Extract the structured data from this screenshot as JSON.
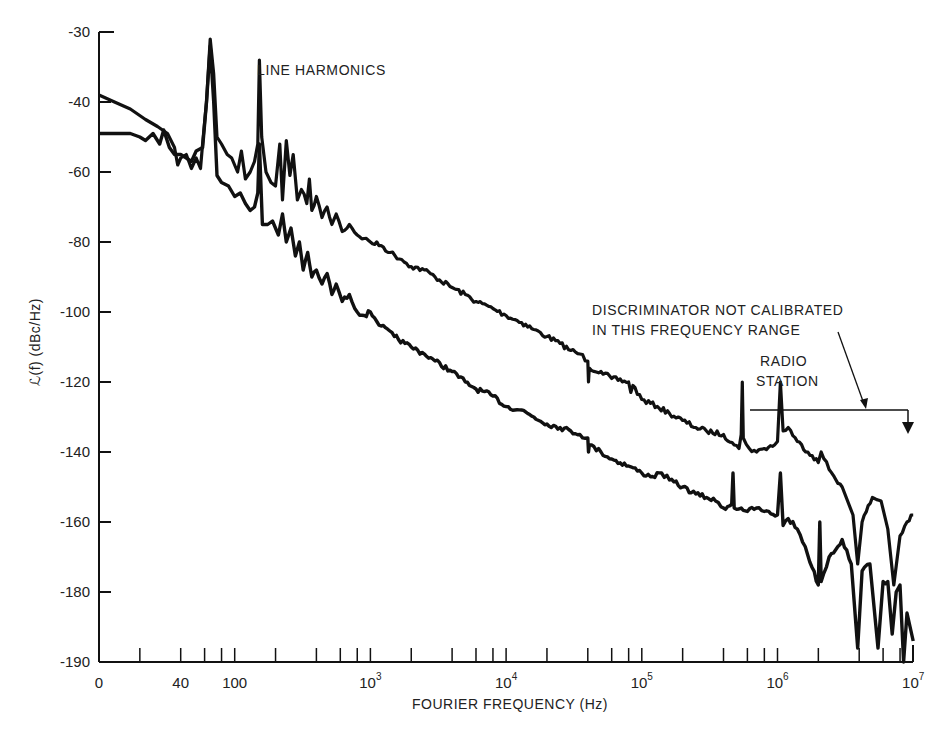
{
  "chart_data": {
    "type": "line",
    "title": "",
    "xlabel": "FOURIER FREQUENCY (Hz)",
    "ylabel": "ℒ(f) (dBc/Hz)",
    "x_scale": "log",
    "x_range_hz": [
      10,
      10000000
    ],
    "x_tick_labels": [
      {
        "value": 10,
        "label": "0"
      },
      {
        "value": 40,
        "label": "40"
      },
      {
        "value": 100,
        "label": "100"
      },
      {
        "value": 1000,
        "label": "10",
        "exp": "3"
      },
      {
        "value": 10000,
        "label": "10",
        "exp": "4"
      },
      {
        "value": 100000,
        "label": "10",
        "exp": "5"
      },
      {
        "value": 1000000,
        "label": "10",
        "exp": "6"
      },
      {
        "value": 10000000,
        "label": "10",
        "exp": "7"
      }
    ],
    "x_minor_ticks_per_decade": [
      2,
      4,
      6,
      8,
      10
    ],
    "y_tick_labels": [
      "-30",
      "-40",
      "-60",
      "-80",
      "-100",
      "-120",
      "-140",
      "-160",
      "-180",
      "-190"
    ],
    "y_tick_values": [
      -30,
      -40,
      -60,
      -80,
      -100,
      -120,
      -140,
      -160,
      -180,
      -190
    ],
    "ylim": [
      -190,
      -30
    ],
    "grid": false,
    "legend": "none",
    "series": [
      {
        "name": "upper trace",
        "points": [
          [
            10,
            -39
          ],
          [
            13,
            -40
          ],
          [
            17,
            -42
          ],
          [
            22,
            -45
          ],
          [
            27,
            -47
          ],
          [
            32,
            -49
          ],
          [
            36,
            -53
          ],
          [
            38,
            -58
          ],
          [
            40,
            -56
          ],
          [
            44,
            -55
          ],
          [
            48,
            -59
          ],
          [
            52,
            -56
          ],
          [
            56,
            -59
          ],
          [
            58,
            -52
          ],
          [
            62,
            -40
          ],
          [
            66,
            -31
          ],
          [
            70,
            -36
          ],
          [
            74,
            -50
          ],
          [
            80,
            -52
          ],
          [
            88,
            -55
          ],
          [
            95,
            -56
          ],
          [
            105,
            -60
          ],
          [
            112,
            -54
          ],
          [
            120,
            -62
          ],
          [
            130,
            -60
          ],
          [
            140,
            -57
          ],
          [
            148,
            -52
          ],
          [
            152,
            -34
          ],
          [
            158,
            -50
          ],
          [
            170,
            -60
          ],
          [
            185,
            -63
          ],
          [
            200,
            -64
          ],
          [
            215,
            -52
          ],
          [
            225,
            -68
          ],
          [
            240,
            -51
          ],
          [
            255,
            -61
          ],
          [
            270,
            -55
          ],
          [
            290,
            -68
          ],
          [
            310,
            -65
          ],
          [
            340,
            -69
          ],
          [
            355,
            -62
          ],
          [
            370,
            -71
          ],
          [
            400,
            -67
          ],
          [
            440,
            -73
          ],
          [
            480,
            -70
          ],
          [
            520,
            -75
          ],
          [
            560,
            -72
          ],
          [
            620,
            -77
          ],
          [
            700,
            -75
          ],
          [
            800,
            -78
          ],
          [
            900,
            -79
          ],
          [
            1000,
            -80
          ],
          [
            1200,
            -81
          ],
          [
            1400,
            -83
          ],
          [
            1700,
            -85
          ],
          [
            2000,
            -87
          ],
          [
            2500,
            -88
          ],
          [
            3000,
            -90
          ],
          [
            4000,
            -93
          ],
          [
            5000,
            -95
          ],
          [
            6000,
            -97
          ],
          [
            8000,
            -99
          ],
          [
            10000,
            -101
          ],
          [
            13000,
            -103
          ],
          [
            16000,
            -105
          ],
          [
            20000,
            -107
          ],
          [
            25000,
            -109
          ],
          [
            30000,
            -111
          ],
          [
            35000,
            -112
          ],
          [
            40000,
            -114
          ],
          [
            40500,
            -120
          ],
          [
            41000,
            -116
          ],
          [
            50000,
            -117
          ],
          [
            60000,
            -119
          ],
          [
            80000,
            -120
          ],
          [
            83000,
            -123
          ],
          [
            86000,
            -121
          ],
          [
            100000,
            -125
          ],
          [
            130000,
            -127
          ],
          [
            160000,
            -129
          ],
          [
            200000,
            -131
          ],
          [
            250000,
            -133
          ],
          [
            300000,
            -134
          ],
          [
            400000,
            -135
          ],
          [
            480000,
            -138
          ],
          [
            520000,
            -139
          ],
          [
            540000,
            -135
          ],
          [
            550000,
            -120
          ],
          [
            560000,
            -136
          ],
          [
            620000,
            -139
          ],
          [
            700000,
            -140
          ],
          [
            800000,
            -139
          ],
          [
            950000,
            -138
          ],
          [
            1000000,
            -137
          ],
          [
            1050000,
            -120
          ],
          [
            1100000,
            -134
          ],
          [
            1200000,
            -133
          ],
          [
            1400000,
            -137
          ],
          [
            1800000,
            -141
          ],
          [
            2000000,
            -143
          ],
          [
            2100000,
            -140
          ],
          [
            2400000,
            -145
          ],
          [
            3000000,
            -150
          ],
          [
            3600000,
            -158
          ],
          [
            3900000,
            -172
          ],
          [
            4200000,
            -160
          ],
          [
            5000000,
            -153
          ],
          [
            5800000,
            -154
          ],
          [
            6500000,
            -162
          ],
          [
            7200000,
            -178
          ],
          [
            8000000,
            -164
          ],
          [
            9000000,
            -160
          ],
          [
            10000000,
            -158
          ]
        ]
      },
      {
        "name": "lower trace",
        "points": [
          [
            10,
            -49
          ],
          [
            13,
            -49
          ],
          [
            17,
            -49
          ],
          [
            20,
            -50
          ],
          [
            22,
            -51
          ],
          [
            25,
            -49
          ],
          [
            28,
            -52
          ],
          [
            30,
            -48
          ],
          [
            33,
            -53
          ],
          [
            36,
            -55
          ],
          [
            40,
            -55
          ],
          [
            44,
            -56
          ],
          [
            48,
            -57
          ],
          [
            52,
            -54
          ],
          [
            58,
            -53
          ],
          [
            62,
            -40
          ],
          [
            66,
            -32
          ],
          [
            70,
            -40
          ],
          [
            74,
            -61
          ],
          [
            80,
            -63
          ],
          [
            90,
            -64
          ],
          [
            100,
            -67
          ],
          [
            110,
            -66
          ],
          [
            120,
            -69
          ],
          [
            130,
            -71
          ],
          [
            140,
            -70
          ],
          [
            148,
            -66
          ],
          [
            152,
            -52
          ],
          [
            160,
            -75
          ],
          [
            175,
            -75
          ],
          [
            190,
            -74
          ],
          [
            210,
            -78
          ],
          [
            225,
            -72
          ],
          [
            240,
            -80
          ],
          [
            260,
            -76
          ],
          [
            280,
            -84
          ],
          [
            300,
            -80
          ],
          [
            320,
            -88
          ],
          [
            345,
            -83
          ],
          [
            370,
            -90
          ],
          [
            400,
            -88
          ],
          [
            440,
            -92
          ],
          [
            480,
            -89
          ],
          [
            520,
            -95
          ],
          [
            560,
            -92
          ],
          [
            620,
            -97
          ],
          [
            700,
            -95
          ],
          [
            800,
            -100
          ],
          [
            900,
            -101
          ],
          [
            1000,
            -100
          ],
          [
            1200,
            -104
          ],
          [
            1500,
            -107
          ],
          [
            1800,
            -109
          ],
          [
            2000,
            -110
          ],
          [
            2500,
            -112
          ],
          [
            3000,
            -114
          ],
          [
            4000,
            -117
          ],
          [
            5000,
            -120
          ],
          [
            6000,
            -122
          ],
          [
            8000,
            -124
          ],
          [
            10000,
            -127
          ],
          [
            13000,
            -128
          ],
          [
            16000,
            -130
          ],
          [
            20000,
            -132
          ],
          [
            25000,
            -133
          ],
          [
            30000,
            -134
          ],
          [
            35000,
            -135
          ],
          [
            40000,
            -136
          ],
          [
            40500,
            -140
          ],
          [
            41000,
            -138
          ],
          [
            50000,
            -140
          ],
          [
            60000,
            -142
          ],
          [
            80000,
            -144
          ],
          [
            100000,
            -146
          ],
          [
            120000,
            -147
          ],
          [
            140000,
            -146
          ],
          [
            160000,
            -148
          ],
          [
            200000,
            -150
          ],
          [
            250000,
            -152
          ],
          [
            300000,
            -153
          ],
          [
            350000,
            -154
          ],
          [
            400000,
            -156
          ],
          [
            460000,
            -155
          ],
          [
            470000,
            -146
          ],
          [
            480000,
            -156
          ],
          [
            540000,
            -156
          ],
          [
            600000,
            -157
          ],
          [
            700000,
            -156
          ],
          [
            800000,
            -157
          ],
          [
            1000000,
            -158
          ],
          [
            1050000,
            -146
          ],
          [
            1100000,
            -161
          ],
          [
            1200000,
            -159
          ],
          [
            1400000,
            -162
          ],
          [
            1600000,
            -167
          ],
          [
            1800000,
            -173
          ],
          [
            2000000,
            -178
          ],
          [
            2050000,
            -160
          ],
          [
            2100000,
            -177
          ],
          [
            2400000,
            -170
          ],
          [
            3000000,
            -165
          ],
          [
            3500000,
            -172
          ],
          [
            3900000,
            -188
          ],
          [
            4200000,
            -174
          ],
          [
            4800000,
            -172
          ],
          [
            5500000,
            -188
          ],
          [
            6000000,
            -177
          ],
          [
            6500000,
            -177
          ],
          [
            7000000,
            -186
          ],
          [
            7500000,
            -180
          ],
          [
            8000000,
            -178
          ],
          [
            8500000,
            -190
          ],
          [
            9000000,
            -183
          ],
          [
            10000000,
            -187
          ]
        ]
      }
    ],
    "annotations": [
      {
        "text": "LINE HARMONICS",
        "x_hz": 130,
        "y": -36
      },
      {
        "text_lines": [
          "DISCRIMINATOR NOT CALIBRATED",
          "IN THIS FREQUENCY RANGE"
        ],
        "x_hz": 480000,
        "y": -98
      },
      {
        "text_lines": [
          "RADIO",
          "STATION"
        ],
        "x_hz": 1400000,
        "y": -115
      },
      {
        "type": "range-bracket",
        "from_hz": 580000,
        "to_hz": 10000000,
        "y": -129
      },
      {
        "type": "arrow",
        "from_hz": 3000000,
        "from_y": -107,
        "to_hz": 4000000,
        "to_y": -129
      }
    ]
  }
}
